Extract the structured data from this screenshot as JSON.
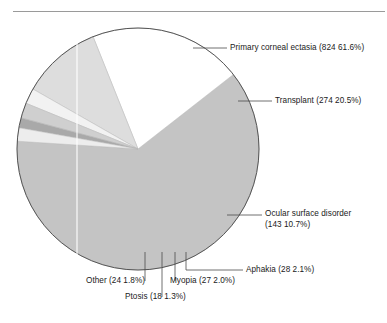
{
  "figure": {
    "type": "pie-chart-figure",
    "has_top_rule": true,
    "background_color": "#ffffff"
  },
  "chart_data": {
    "type": "pie",
    "title": "",
    "xlabel": "",
    "ylabel": "",
    "total": 1338,
    "legend_position": "callout-labels",
    "grid": false,
    "categories": [
      "Primary corneal ectasia",
      "Transplant",
      "Ocular surface disorder",
      "Aphakia",
      "Myopia",
      "Ptosis",
      "Other"
    ],
    "values": [
      824,
      274,
      143,
      28,
      27,
      18,
      24
    ],
    "percents": [
      61.6,
      20.5,
      10.7,
      2.1,
      2.0,
      1.3,
      1.8
    ],
    "colors": [
      "#c4c4c4",
      "#ffffff",
      "#dddddd",
      "#f2f2f2",
      "#cfcfcf",
      "#a9a9a9",
      "#ededed"
    ],
    "slices": [
      {
        "name": "Primary corneal ectasia",
        "value": 824,
        "percent": 61.6,
        "label": "Primary corneal ectasia (824 61.6%)",
        "color": "#c4c4c4",
        "start_deg": -38.0,
        "end_deg": 183.8
      },
      {
        "name": "Transplant",
        "value": 274,
        "percent": 20.5,
        "label": "Transplant (274 20.5%)",
        "color": "#ffffff",
        "start_deg": -111.8,
        "end_deg": -38.0
      },
      {
        "name": "Ocular surface disorder",
        "value": 143,
        "percent": 10.7,
        "label": "Ocular surface disorder",
        "label_line2": "(143 10.7%)",
        "color": "#dddddd",
        "start_deg": -150.3,
        "end_deg": -111.8
      },
      {
        "name": "Aphakia",
        "value": 28,
        "percent": 2.1,
        "label": "Aphakia (28 2.1%)",
        "color": "#f2f2f2",
        "start_deg": -157.8,
        "end_deg": -150.3
      },
      {
        "name": "Myopia",
        "value": 27,
        "percent": 2.0,
        "label": "Myopia (27 2.0%)",
        "color": "#cfcfcf",
        "start_deg": -165.1,
        "end_deg": -157.8
      },
      {
        "name": "Ptosis",
        "value": 18,
        "percent": 1.3,
        "label": "Ptosis (18 1.3%)",
        "color": "#a9a9a9",
        "start_deg": -169.9,
        "end_deg": -165.1
      },
      {
        "name": "Other",
        "value": 24,
        "percent": 1.8,
        "label": "Other (24 1.8%)",
        "color": "#ededed",
        "start_deg": -176.3,
        "end_deg": -169.9
      }
    ],
    "geometry": {
      "center_x": 138,
      "center_y": 149,
      "radius": 121,
      "outline_color": "#555555"
    }
  },
  "callouts": {
    "primary_corneal_ectasia": "Primary corneal ectasia (824 61.6%)",
    "transplant": "Transplant (274 20.5%)",
    "ocular_surface_disorder_line1": "Ocular surface disorder",
    "ocular_surface_disorder_line2": "(143 10.7%)",
    "aphakia": "Aphakia (28 2.1%)",
    "myopia": "Myopia (27 2.0%)",
    "ptosis": "Ptosis (18 1.3%)",
    "other": "Other (24 1.8%)"
  }
}
